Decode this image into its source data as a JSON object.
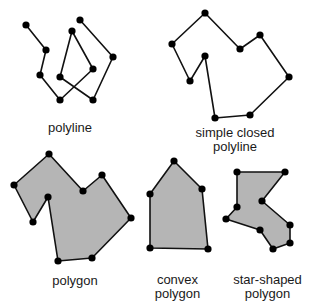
{
  "colors": {
    "stroke": "#111111",
    "fill": "#b5b5b5",
    "vertex": "#000000"
  },
  "figures": [
    {
      "id": "polyline",
      "label_lines": [
        "polyline"
      ],
      "closed": false,
      "filled": false,
      "points": [
        [
          26,
          25
        ],
        [
          46,
          50
        ],
        [
          40,
          75
        ],
        [
          60,
          100
        ],
        [
          93,
          69
        ],
        [
          72,
          31
        ],
        [
          60,
          77
        ],
        [
          93,
          100
        ],
        [
          113,
          57
        ],
        [
          80,
          20
        ]
      ]
    },
    {
      "id": "simple-closed-polyline",
      "label_lines": [
        "simple closed",
        "polyline"
      ],
      "closed": true,
      "filled": false,
      "points": [
        [
          172,
          44
        ],
        [
          205,
          13
        ],
        [
          240,
          49
        ],
        [
          260,
          35
        ],
        [
          289,
          77
        ],
        [
          250,
          115
        ],
        [
          215,
          118
        ],
        [
          205,
          56
        ],
        [
          190,
          81
        ]
      ]
    },
    {
      "id": "polygon",
      "label_lines": [
        "polygon"
      ],
      "closed": true,
      "filled": true,
      "points": [
        [
          14,
          185
        ],
        [
          49,
          154
        ],
        [
          83,
          191
        ],
        [
          102,
          175
        ],
        [
          131,
          218
        ],
        [
          92,
          258
        ],
        [
          58,
          261
        ],
        [
          48,
          197
        ],
        [
          33,
          222
        ]
      ]
    },
    {
      "id": "convex-polygon",
      "label_lines": [
        "convex",
        "polygon"
      ],
      "closed": true,
      "filled": true,
      "points": [
        [
          174,
          161
        ],
        [
          202,
          189
        ],
        [
          208,
          249
        ],
        [
          150,
          248
        ],
        [
          150,
          194
        ]
      ]
    },
    {
      "id": "star-shaped-polygon",
      "label_lines": [
        "star-shaped",
        "polygon"
      ],
      "closed": true,
      "filled": true,
      "points": [
        [
          237,
          172
        ],
        [
          285,
          172
        ],
        [
          262,
          201
        ],
        [
          290,
          225
        ],
        [
          290,
          243
        ],
        [
          273,
          249
        ],
        [
          260,
          230
        ],
        [
          226,
          219
        ],
        [
          237,
          207
        ]
      ]
    }
  ],
  "labels": {
    "polyline": "polyline",
    "simple_closed_1": "simple closed",
    "simple_closed_2": "polyline",
    "polygon": "polygon",
    "convex_1": "convex",
    "convex_2": "polygon",
    "star_1": "star-shaped",
    "star_2": "polygon"
  }
}
